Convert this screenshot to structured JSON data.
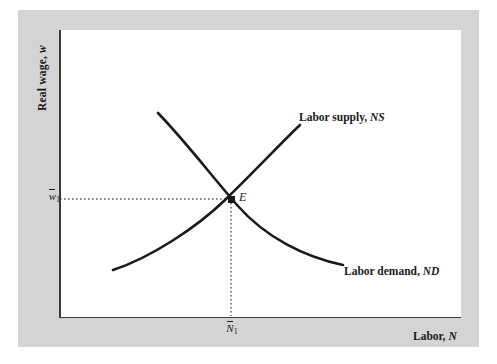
{
  "figure": {
    "type": "economics-diagram"
  },
  "axes": {
    "y_title_text": "Real wage,",
    "y_title_variable": "w",
    "x_title_text": "Labor,",
    "x_title_variable": "N",
    "y_tick_variable": "w",
    "y_tick_subscript": "1",
    "x_tick_variable": "N",
    "x_tick_subscript": "1"
  },
  "curves": {
    "supply": {
      "label_text": "Labor supply,",
      "label_variable": "NS",
      "path": "M 113 270 C 150 258, 196 228, 225 200 C 254 172, 282 142, 300 125"
    },
    "demand": {
      "label_text": "Labor demand,",
      "label_variable": "ND",
      "path": "M 158 113 C 186 142, 210 174, 237 205 C 266 238, 305 257, 343 265"
    }
  },
  "equilibrium": {
    "label": "E",
    "x": 231,
    "y": 199
  },
  "guides": {
    "horizontal_dotted": {
      "x1": 60,
      "y1": 199,
      "x2": 231,
      "y2": 199
    },
    "vertical_dotted": {
      "x1": 231,
      "y1": 199,
      "x2": 231,
      "y2": 316
    }
  },
  "colors": {
    "panel_background": "#d4d4d4",
    "plot_background": "#ffffff",
    "curve": "#1a1a1a",
    "axis": "#3a3a3a",
    "text": "#1a1a1a"
  },
  "chart_data": {
    "type": "line",
    "title": "",
    "xlabel": "Labor, N",
    "ylabel": "Real wage, w",
    "grid": false,
    "legend": "inline-labels",
    "series": [
      {
        "name": "Labor supply, NS",
        "slope": "upward",
        "points": [
          [
            113,
            270
          ],
          [
            169,
            238
          ],
          [
            225,
            200
          ],
          [
            262,
            163
          ],
          [
            300,
            125
          ]
        ]
      },
      {
        "name": "Labor demand, ND",
        "slope": "downward",
        "points": [
          [
            158,
            113
          ],
          [
            197,
            158
          ],
          [
            237,
            205
          ],
          [
            290,
            248
          ],
          [
            343,
            265
          ]
        ]
      }
    ],
    "annotations": [
      {
        "label": "E",
        "x": 231,
        "y": 199,
        "note": "equilibrium point"
      },
      {
        "label": "w1-bar",
        "axis": "y",
        "value": 199
      },
      {
        "label": "N1-bar",
        "axis": "x",
        "value": 231
      }
    ]
  }
}
